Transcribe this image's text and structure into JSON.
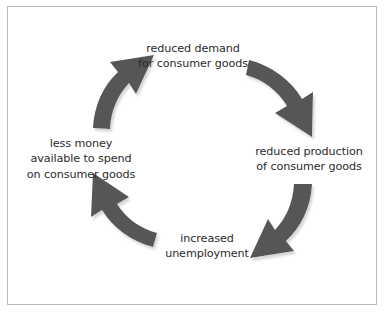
{
  "diagram": {
    "type": "cyclical-flow",
    "direction": "clockwise",
    "border_color": "#b9b9b9",
    "background_color": "#ffffff",
    "arrow_color": "#565656",
    "arrow_shadow_color": "#b0b0b0",
    "text_color": "#2b2b2b",
    "nodes": [
      {
        "id": "reduced-demand",
        "position": "top",
        "text": "reduced demand\nfor consumer goods"
      },
      {
        "id": "reduced-production",
        "position": "right",
        "text": "reduced production\nof consumer goods"
      },
      {
        "id": "increased-unemployment",
        "position": "bottom",
        "text": "increased\nunemployment"
      },
      {
        "id": "less-money",
        "position": "left",
        "text": "less money\navailable to spend\non consumer goods"
      }
    ],
    "arrows": [
      {
        "id": "arrow-demand-to-production",
        "from": "reduced-demand",
        "to": "reduced-production",
        "quadrant": "top-right"
      },
      {
        "id": "arrow-production-to-unemployment",
        "from": "reduced-production",
        "to": "increased-unemployment",
        "quadrant": "bottom-right"
      },
      {
        "id": "arrow-unemployment-to-less-money",
        "from": "increased-unemployment",
        "to": "less-money",
        "quadrant": "bottom-left"
      },
      {
        "id": "arrow-less-money-to-demand",
        "from": "less-money",
        "to": "reduced-demand",
        "quadrant": "top-left"
      }
    ]
  }
}
